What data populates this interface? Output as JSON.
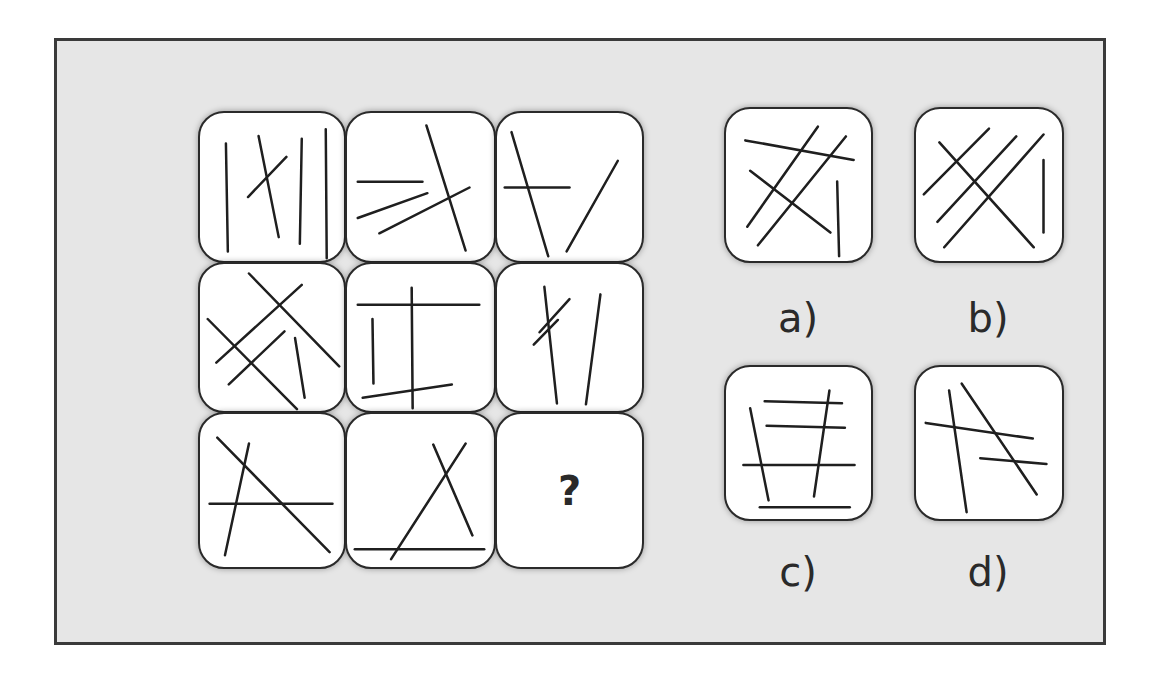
{
  "puzzle": {
    "grid": [
      {
        "id": "r1c1",
        "lines": [
          [
            27,
            32,
            29,
            145
          ],
          [
            61,
            24,
            82,
            130
          ],
          [
            50,
            88,
            90,
            46
          ],
          [
            106,
            27,
            104,
            137
          ],
          [
            131,
            17,
            132,
            152
          ]
        ]
      },
      {
        "id": "r1c2",
        "lines": [
          [
            11,
            72,
            77,
            72
          ],
          [
            11,
            110,
            82,
            84
          ],
          [
            33,
            126,
            125,
            78
          ],
          [
            81,
            13,
            121,
            144
          ]
        ]
      },
      {
        "id": "r1c3",
        "lines": [
          [
            15,
            20,
            53,
            150
          ],
          [
            8,
            78,
            75,
            78
          ],
          [
            125,
            50,
            72,
            145
          ]
        ]
      },
      {
        "id": "r2c1",
        "lines": [
          [
            51,
            10,
            145,
            108
          ],
          [
            8,
            58,
            101,
            153
          ],
          [
            17,
            104,
            106,
            22
          ],
          [
            30,
            127,
            88,
            71
          ],
          [
            99,
            78,
            109,
            141
          ]
        ]
      },
      {
        "id": "r2c2",
        "lines": [
          [
            11,
            43,
            135,
            43
          ],
          [
            66,
            25,
            67,
            152
          ],
          [
            26,
            58,
            27,
            126
          ],
          [
            16,
            141,
            107,
            127
          ]
        ]
      },
      {
        "id": "r2c3",
        "lines": [
          [
            49,
            24,
            62,
            147
          ],
          [
            44,
            72,
            75,
            37
          ],
          [
            38,
            85,
            63,
            59
          ],
          [
            107,
            32,
            92,
            148
          ]
        ]
      },
      {
        "id": "r3c1",
        "lines": [
          [
            18,
            24,
            135,
            140
          ],
          [
            51,
            30,
            26,
            143
          ],
          [
            10,
            91,
            138,
            91
          ]
        ]
      },
      {
        "id": "r3c2",
        "lines": [
          [
            88,
            31,
            128,
            123
          ],
          [
            121,
            30,
            45,
            147
          ],
          [
            8,
            137,
            140,
            137
          ]
        ]
      },
      {
        "id": "r3c3",
        "question": "?",
        "lines": []
      }
    ],
    "options": [
      {
        "label": "a)",
        "lines": [
          [
            20,
            32,
            132,
            52
          ],
          [
            95,
            18,
            22,
            120
          ],
          [
            124,
            28,
            33,
            139
          ],
          [
            25,
            63,
            108,
            126
          ],
          [
            115,
            74,
            117,
            150
          ]
        ]
      },
      {
        "label": "b)",
        "lines": [
          [
            8,
            87,
            75,
            20
          ],
          [
            22,
            115,
            103,
            28
          ],
          [
            29,
            141,
            131,
            26
          ],
          [
            24,
            34,
            121,
            141
          ],
          [
            131,
            52,
            131,
            126
          ]
        ]
      },
      {
        "label": "c)",
        "lines": [
          [
            40,
            35,
            120,
            37
          ],
          [
            42,
            60,
            123,
            62
          ],
          [
            18,
            100,
            133,
            100
          ],
          [
            35,
            143,
            128,
            143
          ],
          [
            25,
            42,
            44,
            136
          ],
          [
            107,
            24,
            91,
            132
          ]
        ]
      },
      {
        "label": "d)",
        "lines": [
          [
            10,
            57,
            120,
            73
          ],
          [
            66,
            93,
            134,
            99
          ],
          [
            34,
            24,
            52,
            148
          ],
          [
            47,
            17,
            124,
            130
          ]
        ]
      }
    ]
  },
  "colors": {
    "background": "#e6e6e6",
    "tile": "#ffffff",
    "stroke": "#1f1f1f"
  }
}
